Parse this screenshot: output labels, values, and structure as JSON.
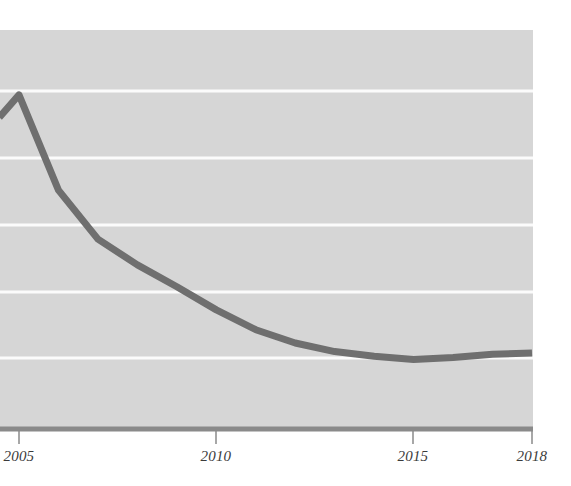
{
  "chart_data": {
    "type": "line",
    "title": "",
    "subtitle": "",
    "xlabel": "",
    "ylabel": "",
    "xlim": [
      2004.5,
      2018.0
    ],
    "ylim": [
      0,
      6
    ],
    "grid": true,
    "grid_orientation": "horizontal",
    "gridline_values": [
      5,
      4,
      3,
      2,
      1
    ],
    "legend": null,
    "legend_position": "none",
    "x_tick_labels": [
      "2005",
      "2010",
      "2015",
      "2018"
    ],
    "x_tick_values": [
      2005,
      2010,
      2015,
      2018
    ],
    "y_tick_labels": [],
    "series": [
      {
        "name": "series-1",
        "color": "#6f6f6f",
        "line_width": 7,
        "x": [
          2004.5,
          2005,
          2006,
          2007,
          2008,
          2009,
          2010,
          2011,
          2012,
          2013,
          2014,
          2015,
          2016,
          2017,
          2018
        ],
        "values": [
          4.68,
          5.02,
          3.58,
          2.84,
          2.45,
          2.12,
          1.77,
          1.47,
          1.27,
          1.14,
          1.07,
          1.02,
          1.05,
          1.1,
          1.12
        ]
      }
    ],
    "annotations": [],
    "colors": {
      "plot_background": "#d6d6d6",
      "page_background": "#ffffff",
      "gridline": "#fbfbfb",
      "axis_line": "#8a8a8a",
      "tick_mark": "#8a8a8a",
      "line_series": "#6f6f6f",
      "tick_label_text": "#3b3b3b"
    }
  },
  "axis": {
    "x_ticks": [
      {
        "label": "2005",
        "value": 2005,
        "px": 19
      },
      {
        "label": "2010",
        "value": 2010,
        "px": 216
      },
      {
        "label": "2015",
        "value": 2015,
        "px": 413
      },
      {
        "label": "2018",
        "value": 2018,
        "px": 532
      }
    ]
  }
}
